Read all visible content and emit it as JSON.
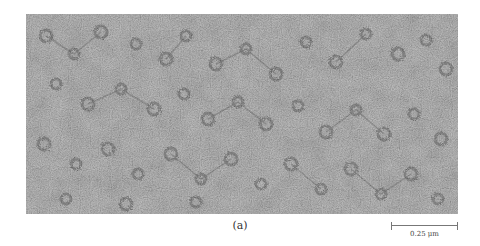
{
  "figure": {
    "type": "micrograph",
    "colors": {
      "background": "#6e6e6e",
      "particles": "#1e1e1e",
      "page": "#ffffff"
    }
  },
  "caption": {
    "label": "(a)"
  },
  "scale_bar": {
    "value": "0.25",
    "unit": "μm",
    "label": "0.25  μm"
  }
}
